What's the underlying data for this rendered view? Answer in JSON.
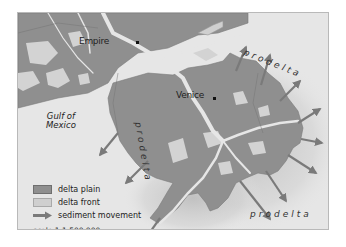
{
  "map": {
    "cities": [
      {
        "name": "Empire",
        "x": 64,
        "y": 13
      },
      {
        "name": "Venice",
        "x": 160,
        "y": 86
      }
    ],
    "water_label": [
      "Gulf of",
      "Mexico"
    ],
    "region_labels": {
      "prodelta_ne": "prodelta",
      "prodelta_w": "prodelta",
      "prodelta_s": "prodelta"
    },
    "colors": {
      "delta_plain": "#8f8f8f",
      "delta_front": "#cfcfcf",
      "water": "#e6e6e6",
      "arrow": "#7a7a7a"
    }
  },
  "legend": {
    "items": [
      {
        "label": "delta plain",
        "symbol": "swatch-dark"
      },
      {
        "label": "delta front",
        "symbol": "swatch-light"
      },
      {
        "label": "sediment movement",
        "symbol": "arrow"
      }
    ],
    "scale": "scale 1:1,500,000"
  }
}
